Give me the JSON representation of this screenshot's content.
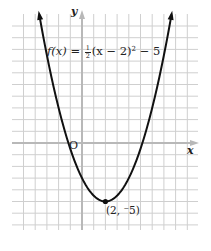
{
  "chart_data": {
    "type": "line",
    "title": "",
    "function_label": {
      "lhs": "f(x)",
      "equals": "=",
      "coef_num": "1",
      "coef_den": "2",
      "body": "(x − 2)",
      "exponent": "2",
      "tail": "− 5"
    },
    "expression": "f(x) = 1/2 (x - 2)^2 - 5",
    "xlabel": "x",
    "ylabel": "y",
    "origin_label": "O",
    "vertex": {
      "x": 2,
      "y": -5,
      "label": "(2, ⁻5)"
    },
    "xlim": [
      -5.2,
      9.5
    ],
    "ylim": [
      -7.2,
      11.2
    ],
    "grid": true,
    "grid_spacing": 1,
    "series": [
      {
        "name": "f(x) = 1/2 (x - 2)^2 - 5",
        "x": [
          -3.65,
          -3,
          -2,
          -1,
          0,
          1,
          2,
          3,
          4,
          5,
          6,
          7,
          7.65
        ],
        "y": [
          10.96,
          7.5,
          3,
          -0.5,
          -3,
          -4.5,
          -5,
          -4.5,
          -3,
          -0.5,
          3,
          7.5,
          10.96
        ]
      }
    ],
    "style": {
      "curve_color": "#111111",
      "axis_color": "#b8b8b8",
      "grid_color": "#cfcfcf"
    }
  }
}
